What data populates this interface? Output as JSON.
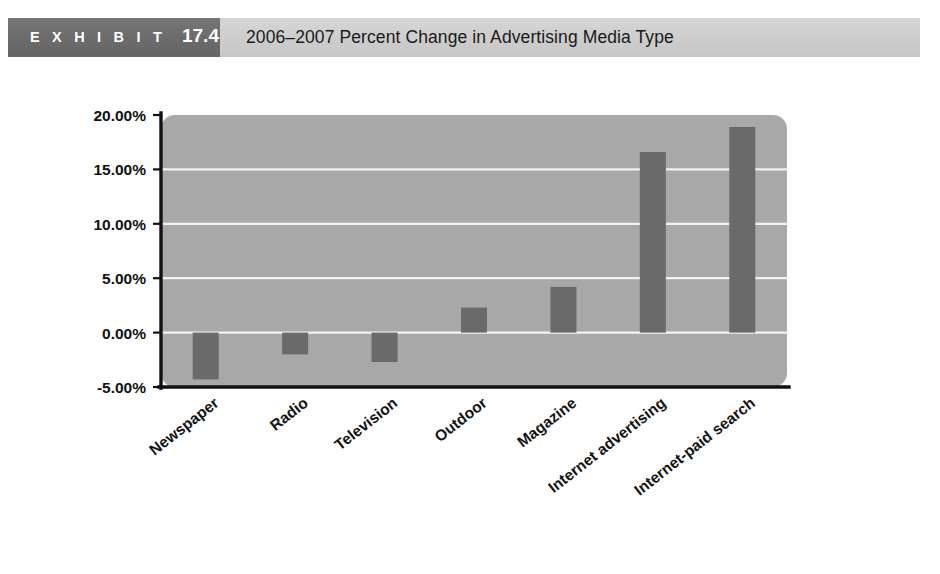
{
  "exhibit": {
    "label": "E X H I B I T",
    "number": "17.4",
    "title": "2006–2007 Percent Change in Advertising Media Type",
    "tag_bg": "#6e6e6e",
    "band_bg": "#cfcfcf"
  },
  "chart_data": {
    "type": "bar",
    "title": "2006–2007 Percent Change in Advertising Media Type",
    "xlabel": "",
    "ylabel": "",
    "categories": [
      "Newspaper",
      "Radio",
      "Television",
      "Outdoor",
      "Magazine",
      "Internet advertising",
      "Internet-paid search"
    ],
    "values": [
      -4.3,
      -2.0,
      -2.7,
      2.3,
      4.2,
      16.6,
      18.9
    ],
    "value_labels": [
      "-4.30%",
      "-2.00%",
      "-2.70%",
      "2.30%",
      "4.20%",
      "16.60%",
      "18.90%"
    ],
    "ylim": [
      -5,
      20
    ],
    "yticks": [
      20,
      15,
      10,
      5,
      0,
      -5
    ],
    "ytick_labels": [
      "20.00%",
      "15.00%",
      "10.00%",
      "5.00%",
      "0.00%",
      "-5.00%"
    ],
    "grid": true,
    "gridlines_at": [
      15,
      10,
      5,
      0
    ],
    "legend": null,
    "bar_color": "#6a6a6a",
    "plot_bg_color": "#a8a8a8",
    "gridline_color": "#f2f2f2",
    "axis_color": "#111111",
    "xtick_rotation_deg": -38
  }
}
